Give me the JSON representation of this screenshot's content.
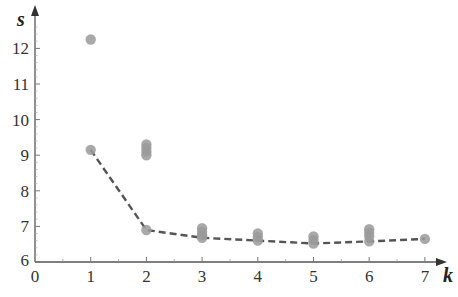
{
  "chart_data": {
    "type": "scatter",
    "title": "",
    "xlabel": "k",
    "ylabel": "s",
    "xlim": [
      0,
      7.5
    ],
    "ylim": [
      6,
      12.7
    ],
    "x_ticks": [
      0,
      1,
      2,
      3,
      4,
      5,
      6,
      7
    ],
    "y_ticks": [
      6,
      7,
      8,
      9,
      10,
      11,
      12
    ],
    "grid": false,
    "legend": null,
    "series": [
      {
        "name": "samples",
        "kind": "scatter",
        "color": "#9a9a9a",
        "points": [
          {
            "x": 1,
            "y": 12.25
          },
          {
            "x": 1,
            "y": 9.15
          },
          {
            "x": 2,
            "y": 9.3
          },
          {
            "x": 2,
            "y": 9.2
          },
          {
            "x": 2,
            "y": 9.1
          },
          {
            "x": 2,
            "y": 9.0
          },
          {
            "x": 2,
            "y": 6.9
          },
          {
            "x": 3,
            "y": 6.95
          },
          {
            "x": 3,
            "y": 6.85
          },
          {
            "x": 3,
            "y": 6.75
          },
          {
            "x": 3,
            "y": 6.68
          },
          {
            "x": 4,
            "y": 6.8
          },
          {
            "x": 4,
            "y": 6.7
          },
          {
            "x": 4,
            "y": 6.6
          },
          {
            "x": 5,
            "y": 6.72
          },
          {
            "x": 5,
            "y": 6.62
          },
          {
            "x": 5,
            "y": 6.52
          },
          {
            "x": 6,
            "y": 6.92
          },
          {
            "x": 6,
            "y": 6.82
          },
          {
            "x": 6,
            "y": 6.72
          },
          {
            "x": 6,
            "y": 6.58
          },
          {
            "x": 7,
            "y": 6.65
          }
        ]
      },
      {
        "name": "minimum",
        "kind": "line",
        "style": "dashed",
        "color": "#555555",
        "x": [
          1,
          2,
          3,
          4,
          5,
          6,
          7
        ],
        "values": [
          9.15,
          6.9,
          6.68,
          6.6,
          6.52,
          6.58,
          6.65
        ]
      }
    ]
  }
}
